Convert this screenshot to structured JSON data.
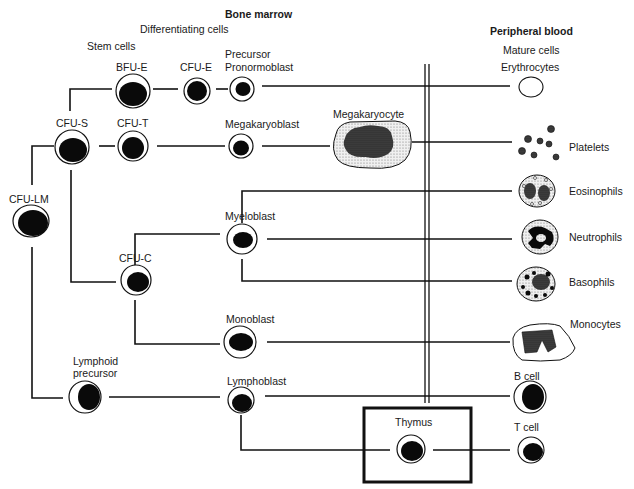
{
  "diagram": {
    "title_bone_marrow": "Bone marrow",
    "title_peripheral_blood": "Peripheral blood",
    "section_labels": {
      "differentiating_cells": "Differentiating cells",
      "stem_cells": "Stem cells",
      "mature_cells": "Mature cells"
    },
    "cells": {
      "bfu_e": "BFU-E",
      "cfu_e": "CFU-E",
      "precursor": "Precursor",
      "pronormoblast": "Pronormoblast",
      "cfu_s": "CFU-S",
      "cfu_t": "CFU-T",
      "megakaryoblast": "Megakaryoblast",
      "megakaryocyte": "Megakaryocyte",
      "cfu_lm": "CFU-LM",
      "myeloblast": "Myeloblast",
      "cfu_c": "CFU-C",
      "monoblast": "Monoblast",
      "lymphoid": "Lymphoid",
      "precursor2": "precursor",
      "lymphoblast": "Lymphoblast",
      "thymus": "Thymus"
    },
    "mature": {
      "erythrocytes": "Erythrocytes",
      "platelets": "Platelets",
      "eosinophils": "Eosinophils",
      "neutrophils": "Neutrophils",
      "basophils": "Basophils",
      "monocytes": "Monocytes",
      "b_cell": "B cell",
      "t_cell": "T cell"
    },
    "colors": {
      "line": "#111111",
      "nucleus": "#0a0a0a",
      "stipple": "#d9d9d9",
      "dark_stipple": "#3a3a3a"
    }
  }
}
